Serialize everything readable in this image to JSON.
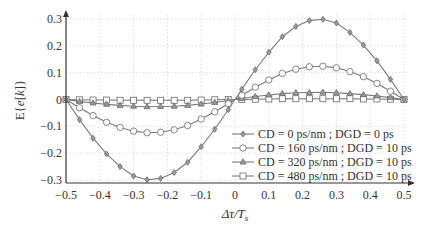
{
  "chart_data": {
    "type": "line",
    "title": "",
    "xlabel": "Δτ/T_s",
    "ylabel": "E{e[k]}",
    "xlim": [
      -0.5,
      0.5
    ],
    "ylim": [
      -0.3,
      0.3
    ],
    "xticks": [
      -0.5,
      -0.4,
      -0.3,
      -0.2,
      -0.1,
      0,
      0.1,
      0.2,
      0.3,
      0.4,
      0.5
    ],
    "xtick_labels": [
      "−0.5",
      "−0.4",
      "−0.3",
      "−0.2",
      "−0.1",
      "0",
      "0.1",
      "0.2",
      "0.3",
      "0.4",
      "0.5"
    ],
    "yticks": [
      -0.3,
      -0.2,
      -0.1,
      0,
      0.1,
      0.2,
      0.3
    ],
    "ytick_labels": [
      "−0.3",
      "−0.2",
      "−0.1",
      "0",
      "0.1",
      "0.2",
      "0.3"
    ],
    "grid": true,
    "legend_position": "lower right",
    "x": [
      -0.5,
      -0.46,
      -0.42,
      -0.38,
      -0.34,
      -0.3,
      -0.26,
      -0.22,
      -0.18,
      -0.14,
      -0.1,
      -0.06,
      -0.02,
      0.02,
      0.06,
      0.1,
      0.14,
      0.18,
      0.22,
      0.26,
      0.3,
      0.34,
      0.38,
      0.42,
      0.46,
      0.5
    ],
    "series": [
      {
        "name": "CD = 0 ps/nm ; DGD = 0 ps",
        "marker": "diamond",
        "values": [
          0,
          -0.075,
          -0.144,
          -0.203,
          -0.25,
          -0.285,
          -0.299,
          -0.294,
          -0.272,
          -0.234,
          -0.176,
          -0.111,
          -0.038,
          0.038,
          0.111,
          0.176,
          0.234,
          0.272,
          0.294,
          0.299,
          0.285,
          0.25,
          0.203,
          0.144,
          0.075,
          0
        ]
      },
      {
        "name": "CD = 160 ps/nm ; DGD = 10 ps",
        "marker": "circle",
        "values": [
          0,
          -0.031,
          -0.06,
          -0.085,
          -0.104,
          -0.118,
          -0.124,
          -0.122,
          -0.113,
          -0.097,
          -0.073,
          -0.046,
          -0.016,
          0.016,
          0.046,
          0.073,
          0.097,
          0.113,
          0.122,
          0.124,
          0.118,
          0.104,
          0.085,
          0.06,
          0.031,
          0
        ]
      },
      {
        "name": "CD = 320 ps/nm ; DGD = 10 ps",
        "marker": "triangle",
        "values": [
          0,
          -0.007,
          -0.013,
          -0.018,
          -0.022,
          -0.025,
          -0.027,
          -0.026,
          -0.025,
          -0.022,
          -0.017,
          -0.011,
          -0.004,
          0.004,
          0.011,
          0.017,
          0.022,
          0.025,
          0.026,
          0.027,
          0.025,
          0.022,
          0.018,
          0.013,
          0.007,
          0
        ]
      },
      {
        "name": "CD = 480 ps/nm ; DGD = 10 ps",
        "marker": "square",
        "values": [
          0,
          -0.001,
          -0.002,
          -0.002,
          -0.003,
          -0.003,
          -0.003,
          -0.003,
          -0.003,
          -0.003,
          -0.002,
          -0.001,
          0,
          0,
          0.001,
          0.002,
          0.003,
          0.003,
          0.003,
          0.003,
          0.003,
          0.003,
          0.002,
          0.002,
          0.001,
          0
        ]
      }
    ]
  },
  "colors": {
    "line": "#7a7a7a",
    "marker_fill": "#9a9a9a",
    "axis": "#333333",
    "grid": "#d8d8d8"
  }
}
